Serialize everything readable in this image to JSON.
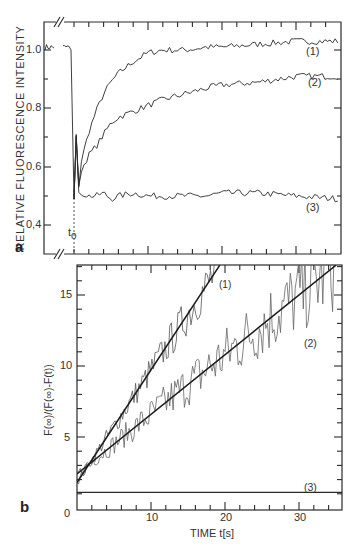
{
  "chart_data": [
    {
      "panel": "a",
      "type": "line",
      "title": "",
      "xlabel": "",
      "ylabel": "RELATIVE FLUORESCENCE INTENSITY",
      "ylim": [
        0.32,
        1.1
      ],
      "yticks": [
        0.4,
        0.6,
        0.8,
        1.0
      ],
      "ytick_labels": [
        "0,4",
        "0.6",
        "0.8",
        "1.0"
      ],
      "xlim": [
        -4,
        36
      ],
      "axis_break": true,
      "annotations": [
        {
          "text": "t",
          "sub": "o",
          "x": 0,
          "note": "dashed vertical marker at bleach time"
        }
      ],
      "grid": false,
      "legend": "inline labels (1), (2), (3) at right",
      "x": [
        -4,
        -2,
        0,
        0.5,
        1,
        2,
        3,
        4,
        5,
        6,
        8,
        10,
        12,
        15,
        18,
        20,
        25,
        30,
        36
      ],
      "series": [
        {
          "name": "(1)",
          "values": [
            1.02,
            1.01,
            1.01,
            0.5,
            0.62,
            0.72,
            0.79,
            0.85,
            0.89,
            0.92,
            0.96,
            0.99,
            1.0,
            1.0,
            1.01,
            1.01,
            1.02,
            1.03,
            1.03
          ]
        },
        {
          "name": "(2)",
          "values": [
            1.02,
            1.01,
            1.01,
            0.5,
            0.59,
            0.64,
            0.67,
            0.71,
            0.75,
            0.77,
            0.79,
            0.81,
            0.83,
            0.85,
            0.87,
            0.88,
            0.89,
            0.91,
            0.91
          ]
        },
        {
          "name": "(3)",
          "values": [
            1.02,
            1.01,
            1.01,
            0.5,
            0.51,
            0.5,
            0.5,
            0.51,
            0.49,
            0.5,
            0.51,
            0.5,
            0.5,
            0.5,
            0.5,
            0.51,
            0.51,
            0.5,
            0.49
          ]
        }
      ]
    },
    {
      "panel": "b",
      "type": "line",
      "title": "",
      "xlabel": "TIME t[s]",
      "ylabel": "F(∞)/(F(∞)-F(t))",
      "xlim": [
        0,
        36
      ],
      "ylim": [
        0,
        17.1
      ],
      "xticks": [
        0,
        10,
        20,
        30
      ],
      "yticks": [
        0,
        5,
        10,
        15
      ],
      "grid": false,
      "legend": "inline labels (1), (2), (3)",
      "series": [
        {
          "name": "(1) fit",
          "kind": "linear fit",
          "intercept": 1.8,
          "slope": 0.79,
          "x": [
            0,
            19.3
          ],
          "values": [
            1.8,
            17.1
          ]
        },
        {
          "name": "(2) fit",
          "kind": "linear fit",
          "intercept": 2.4,
          "slope": 0.42,
          "x": [
            0,
            35
          ],
          "values": [
            2.4,
            17.1
          ]
        },
        {
          "name": "(3)",
          "kind": "constant",
          "x": [
            0,
            36
          ],
          "values": [
            1.1,
            1.1
          ]
        },
        {
          "name": "(1) data",
          "kind": "noisy data",
          "x": [
            0,
            2,
            4,
            6,
            8,
            10,
            12,
            14,
            16,
            18,
            19
          ],
          "values": [
            1.9,
            3.5,
            4.6,
            6.8,
            8.5,
            9.6,
            11.5,
            13.0,
            14.5,
            16.0,
            16.5
          ]
        },
        {
          "name": "(2) data",
          "kind": "noisy data",
          "x": [
            0,
            4,
            8,
            12,
            16,
            20,
            24,
            28,
            32,
            35
          ],
          "values": [
            2.5,
            4.2,
            6.0,
            7.8,
            9.0,
            10.5,
            12.0,
            13.5,
            15.0,
            16.5
          ]
        }
      ]
    }
  ],
  "panel_a": {
    "letter": "a",
    "ylabel": "RELATIVE FLUORESCENCE INTENSITY",
    "ytick_labels": [
      "1.0",
      "0.8",
      "0.6",
      "0,4"
    ],
    "t0_label": "t",
    "t0_sub": "o",
    "curve_labels": [
      "(1)",
      "(2)",
      "(3)"
    ]
  },
  "panel_b": {
    "letter": "b",
    "ylabel": "F(∞)/(F(∞)-F(t))",
    "xlabel": "TIME t[s]",
    "ytick_labels": [
      "15",
      "10",
      "5",
      "0"
    ],
    "xtick_labels": [
      "10",
      "20",
      "30"
    ],
    "curve_labels": [
      "(1)",
      "(2)",
      "(3)"
    ]
  },
  "colors": {
    "ink": "#2a2a2a",
    "background": "#ffffff",
    "noisy": "#555555"
  }
}
